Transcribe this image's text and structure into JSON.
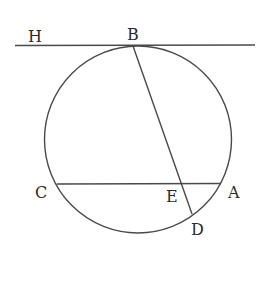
{
  "diagram": {
    "type": "circle-geometry",
    "colors": {
      "line": "#4a4a4a",
      "text": "#2a2a2a",
      "background": "#ffffff"
    },
    "labels": {
      "H": "H",
      "B": "B",
      "C": "C",
      "E": "E",
      "A": "A",
      "D": "D"
    },
    "elements": [
      {
        "kind": "circle",
        "name": "circle"
      },
      {
        "kind": "tangent-line",
        "name": "HB",
        "through": [
          "H",
          "B"
        ]
      },
      {
        "kind": "chord",
        "name": "CA",
        "endpoints": [
          "C",
          "A"
        ]
      },
      {
        "kind": "chord",
        "name": "BD",
        "endpoints": [
          "B",
          "D"
        ],
        "intersects": "CA at E"
      }
    ]
  }
}
